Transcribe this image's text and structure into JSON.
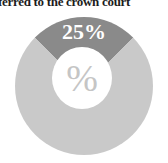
{
  "headline": {
    "text": "ferred to the crown court"
  },
  "colors": {
    "background": "#ffffff",
    "headline_text": "#1c1c1c",
    "slice_dark": "#8a8a8a",
    "slice_light": "#c9c9c9",
    "hole": "#ffffff",
    "center_symbol": "#c5c5c5",
    "slice_label_text": "#ffffff"
  },
  "chart_data": {
    "type": "pie",
    "subtype": "donut",
    "title": "ferred to the crown court",
    "slices": [
      {
        "label": "25%",
        "value": 25,
        "color": "#8a8a8a"
      },
      {
        "label": "",
        "value": 75,
        "color": "#c9c9c9"
      }
    ],
    "slice_label": "25%",
    "center_label": "%",
    "start_angle_deg": -45,
    "legend": "none"
  }
}
